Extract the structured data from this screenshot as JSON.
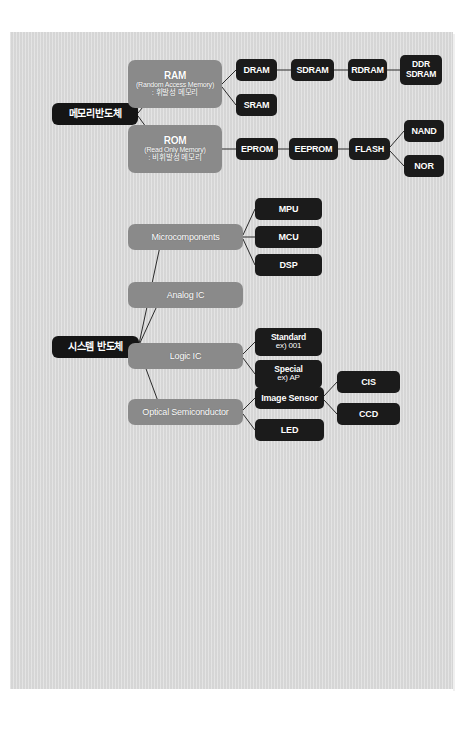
{
  "document": {
    "background_color": "#d8d8d8",
    "page_background": "#ffffff",
    "node_dark_color": "#1b1b1b",
    "node_gray_color": "#8a8a8a",
    "line_color": "#2b2b2b",
    "page_mark": ""
  },
  "diagram": {
    "type": "tree",
    "title": "",
    "roots": [
      {
        "id": "memory",
        "label": "메모리반도체"
      },
      {
        "id": "system",
        "label": "시스템 반도체"
      }
    ],
    "memory_branch": {
      "ram": {
        "title": "RAM",
        "subtitle": "(Random Access Memory)",
        "note": ": 휘발성 메모리",
        "children": [
          {
            "label": "DRAM"
          },
          {
            "label": "SRAM"
          }
        ],
        "dram_chain": [
          {
            "label": "SDRAM"
          },
          {
            "label": "RDRAM"
          },
          {
            "label_line1": "DDR",
            "label_line2": "SDRAM"
          }
        ]
      },
      "rom": {
        "title": "ROM",
        "subtitle": "(Read Only Memory)",
        "note": ": 비휘발성 메모리",
        "chain": [
          {
            "label": "EPROM"
          },
          {
            "label": "EEPROM"
          },
          {
            "label": "FLASH"
          }
        ],
        "flash_children": [
          {
            "label": "NAND"
          },
          {
            "label": "NOR"
          }
        ]
      }
    },
    "system_branch": {
      "categories": [
        {
          "label": "Microcomponents",
          "children": [
            {
              "label": "MPU"
            },
            {
              "label": "MCU"
            },
            {
              "label": "DSP"
            }
          ]
        },
        {
          "label": "Analog IC",
          "children": []
        },
        {
          "label": "Logic IC",
          "children": [
            {
              "label_line1": "Standard",
              "label_line2": "ex) 001"
            },
            {
              "label_line1": "Special",
              "label_line2": "ex) AP"
            }
          ]
        },
        {
          "label": "Optical Semiconductor",
          "children": [
            {
              "label": "Image Sensor"
            },
            {
              "label": "LED"
            }
          ],
          "image_sensor_children": [
            {
              "label": "CIS"
            },
            {
              "label": "CCD"
            }
          ]
        }
      ]
    }
  }
}
